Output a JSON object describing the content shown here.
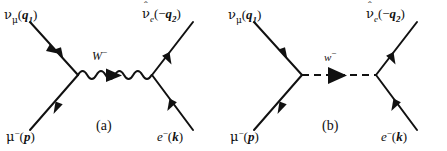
{
  "figure": {
    "kind": "feynman-diagram-pair",
    "background_color": "#ffffff",
    "line_color": "#111111",
    "width": 447,
    "height": 151
  },
  "diagrams": [
    {
      "id": "a",
      "caption": "(a)",
      "propagator": {
        "style": "wavy",
        "particle": "W",
        "charge": "−",
        "arrow_direction": "right"
      },
      "legs": [
        {
          "position": "top-left",
          "particle": "ν",
          "subscript": "μ",
          "momentum": "q",
          "momentum_index": "1",
          "momentum_sign": "",
          "arrow": "outgoing",
          "label_text": "νμ(q1)"
        },
        {
          "position": "top-right",
          "particle": "ν",
          "hat": true,
          "subscript": "e",
          "momentum": "q",
          "momentum_index": "2",
          "momentum_sign": "−",
          "arrow": "incoming",
          "label_text": "ν̂e(−q2)"
        },
        {
          "position": "bottom-left",
          "particle": "μ",
          "charge": "−",
          "momentum": "p",
          "momentum_index": "",
          "arrow": "incoming",
          "label_text": "μ−(p)"
        },
        {
          "position": "bottom-right",
          "particle": "e",
          "charge": "−",
          "momentum": "k",
          "momentum_index": "",
          "arrow": "outgoing",
          "label_text": "e−(k)"
        }
      ]
    },
    {
      "id": "b",
      "caption": "(b)",
      "propagator": {
        "style": "dashed",
        "particle": "w",
        "charge": "−",
        "arrow_direction": "right"
      },
      "legs": [
        {
          "position": "top-left",
          "particle": "ν",
          "subscript": "μ",
          "momentum": "q",
          "momentum_index": "1",
          "momentum_sign": "",
          "arrow": "outgoing",
          "label_text": "νμ(q1)"
        },
        {
          "position": "top-right",
          "particle": "ν",
          "hat": true,
          "subscript": "e",
          "momentum": "q",
          "momentum_index": "2",
          "momentum_sign": "−",
          "arrow": "incoming",
          "label_text": "ν̂e(−q2)"
        },
        {
          "position": "bottom-left",
          "particle": "μ",
          "charge": "−",
          "momentum": "p",
          "momentum_index": "",
          "arrow": "incoming",
          "label_text": "μ−(p)"
        },
        {
          "position": "bottom-right",
          "particle": "e",
          "charge": "−",
          "momentum": "k",
          "momentum_index": "",
          "arrow": "outgoing",
          "label_text": "e−(k)"
        }
      ]
    }
  ],
  "glyphs": {
    "nu": "ν",
    "mu": "μ",
    "hat": "ˆ",
    "minus": "−",
    "lparen": "(",
    "rparen": ")",
    "W_upper": "W",
    "w_lower": "w",
    "q": "q",
    "p": "p",
    "k": "k",
    "e": "e",
    "one": "1",
    "two": "2",
    "caption_a": "(a)",
    "caption_b": "(b)"
  }
}
